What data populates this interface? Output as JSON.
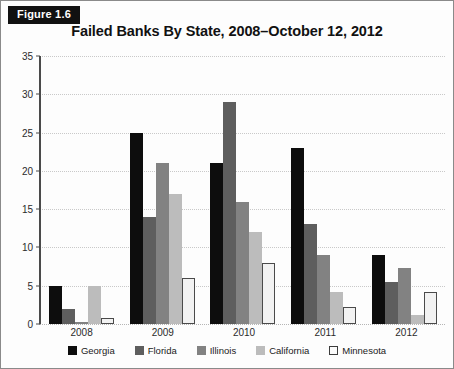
{
  "figure": {
    "badge_label": "Figure 1.6",
    "title": "Failed Banks By State, 2008–October 12, 2012"
  },
  "colors": {
    "georgia": "#0d0d0d",
    "florida": "#5e5e5e",
    "illinois": "#828282",
    "california": "#bcbcbc",
    "minnesota": "#f2f2f2",
    "minnesota_border": "#4a4a4a",
    "gridline": "#c9c9c9",
    "axis": "#4a4a4a",
    "frame": "#8a8a8a"
  },
  "chart_data": {
    "type": "bar",
    "title": "Failed Banks By State, 2008–October 12, 2012",
    "xlabel": "",
    "ylabel": "",
    "categories": [
      "2008",
      "2009",
      "2010",
      "2011",
      "2012"
    ],
    "series": [
      {
        "name": "Georgia",
        "values": [
          5,
          25,
          21,
          23,
          9
        ]
      },
      {
        "name": "Florida",
        "values": [
          2,
          14,
          29,
          13,
          5.5
        ]
      },
      {
        "name": "Illinois",
        "values": [
          0.3,
          21,
          16,
          9,
          7.3
        ]
      },
      {
        "name": "California",
        "values": [
          5,
          17,
          12,
          4.2,
          1.2
        ]
      },
      {
        "name": "Minnesota",
        "values": [
          0.8,
          6,
          8,
          2.2,
          4.2
        ]
      }
    ],
    "ylim": [
      0,
      35
    ],
    "yticks": [
      0,
      5,
      10,
      15,
      20,
      25,
      30,
      35
    ],
    "ytick_labels": [
      "0",
      "5",
      "10",
      "15",
      "20",
      "25",
      "30",
      "35"
    ],
    "grid": true,
    "grid_axis": "y",
    "legend_position": "bottom",
    "legend_entries": [
      "Georgia",
      "Florida",
      "Illinois",
      "California",
      "Minnesota"
    ]
  }
}
